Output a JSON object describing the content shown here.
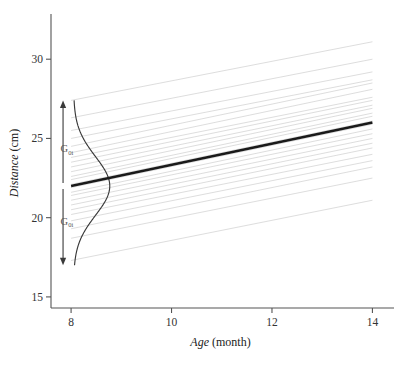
{
  "chart_data": {
    "type": "line",
    "title": "",
    "xlabel_italic": "Age",
    "xlabel_unit": "(month)",
    "ylabel_italic": "Distance",
    "ylabel_unit": "(cm)",
    "xlim": [
      7.6,
      14.35
    ],
    "ylim": [
      14.3,
      32.6
    ],
    "xticks": [
      8,
      10,
      12,
      14
    ],
    "xtick_labels": [
      "8",
      "10",
      "12",
      "14"
    ],
    "yticks": [
      15,
      20,
      25,
      30
    ],
    "ytick_labels": [
      "15",
      "20",
      "25",
      "30"
    ],
    "grid": false,
    "legend": "none",
    "series": [
      {
        "name": "population-average-regression",
        "style": "thick-black-line",
        "color": "#1a1a1a",
        "x": [
          8,
          14
        ],
        "y": [
          22.0,
          26.0
        ]
      },
      {
        "name": "subject-trajectories",
        "style": "faint-gray-lines",
        "color": "#d9d9d9",
        "x_start": 8,
        "x_end": 14,
        "lines": [
          {
            "y_start": 27.4,
            "y_end": 31.1
          },
          {
            "y_start": 26.3,
            "y_end": 30.0
          },
          {
            "y_start": 25.5,
            "y_end": 29.2
          },
          {
            "y_start": 25.0,
            "y_end": 28.7
          },
          {
            "y_start": 24.5,
            "y_end": 28.5
          },
          {
            "y_start": 24.1,
            "y_end": 28.1
          },
          {
            "y_start": 23.8,
            "y_end": 27.6
          },
          {
            "y_start": 23.5,
            "y_end": 27.4
          },
          {
            "y_start": 23.2,
            "y_end": 27.1
          },
          {
            "y_start": 22.9,
            "y_end": 26.9
          },
          {
            "y_start": 22.6,
            "y_end": 26.6
          },
          {
            "y_start": 22.4,
            "y_end": 26.4
          },
          {
            "y_start": 22.1,
            "y_end": 26.1
          },
          {
            "y_start": 21.9,
            "y_end": 25.9
          },
          {
            "y_start": 21.6,
            "y_end": 25.6
          },
          {
            "y_start": 21.4,
            "y_end": 25.3
          },
          {
            "y_start": 21.1,
            "y_end": 25.0
          },
          {
            "y_start": 20.8,
            "y_end": 24.7
          },
          {
            "y_start": 20.5,
            "y_end": 24.4
          },
          {
            "y_start": 20.2,
            "y_end": 24.0
          },
          {
            "y_start": 19.8,
            "y_end": 23.6
          },
          {
            "y_start": 19.3,
            "y_end": 23.2
          },
          {
            "y_start": 18.7,
            "y_end": 22.5
          },
          {
            "y_start": 17.3,
            "y_end": 21.1
          }
        ]
      },
      {
        "name": "random-intercept-density",
        "style": "normal-density-curve-rotated",
        "color": "#3a3a3a",
        "center_y": 22.0,
        "sd_y": 1.85,
        "x_base": 8.05,
        "amplitude_x": 0.72,
        "y_top": 27.4,
        "y_bottom": 17.0
      }
    ],
    "annotations": [
      {
        "name": "random-intercept-spread-arrow",
        "type": "double-headed-arrow",
        "x": 7.84,
        "y_top": 27.4,
        "y_bottom": 17.0,
        "y_mid": 22.0,
        "color": "#3a3a3a"
      },
      {
        "name": "upper-variance-label",
        "text": "G",
        "subscript": "0i",
        "x": 7.79,
        "y": 24.4
      },
      {
        "name": "lower-variance-label",
        "text": "G",
        "subscript": "0i",
        "x": 7.79,
        "y": 19.8
      }
    ]
  },
  "axes": {
    "x_title_italic": "Age",
    "x_title_unit": "(month)",
    "y_title_italic": "Distance",
    "y_title_unit": "(cm)",
    "xtick_labels": [
      "8",
      "10",
      "12",
      "14"
    ],
    "ytick_labels": [
      "15",
      "20",
      "25",
      "30"
    ],
    "axis_color": "#555555"
  },
  "annotations": {
    "upper_label_main": "G",
    "upper_label_sub": "0i",
    "lower_label_main": "G",
    "lower_label_sub": "0i"
  },
  "colors": {
    "background": "#ffffff",
    "axis": "#555555",
    "regression_line": "#1a1a1a",
    "subject_lines": "#d9d9d9",
    "density_curve": "#3a3a3a",
    "arrow": "#3a3a3a",
    "text": "#2b2b2b"
  }
}
